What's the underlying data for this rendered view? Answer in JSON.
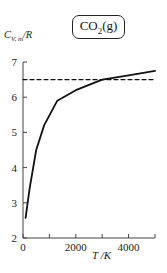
{
  "chart_data": {
    "type": "line",
    "title": "CO2(g)",
    "xlabel": "T /K",
    "ylabel": "C_V,m/R",
    "xlim": [
      0,
      5000
    ],
    "ylim": [
      2,
      7
    ],
    "xticks": [
      0,
      1000,
      2000,
      3000,
      4000,
      5000
    ],
    "xtick_labels": [
      "0",
      "",
      "2000",
      "",
      "4000",
      ""
    ],
    "yticks": [
      2,
      3,
      4,
      5,
      6,
      7
    ],
    "ytick_labels": [
      "2",
      "3",
      "4",
      "5",
      "6",
      "7"
    ],
    "grid": false,
    "legend": "none",
    "series": [
      {
        "name": "C_V,m/R (CO2)",
        "style": "solid",
        "x": [
          100,
          250,
          500,
          800,
          1300,
          2000,
          3000,
          4000,
          5000
        ],
        "values": [
          2.57,
          3.4,
          4.5,
          5.2,
          5.9,
          6.2,
          6.5,
          6.62,
          6.75
        ]
      },
      {
        "name": "classical limit",
        "style": "dashed",
        "x": [
          0,
          5000
        ],
        "values": [
          6.5,
          6.5
        ]
      }
    ]
  },
  "labels": {
    "species_main": "CO",
    "species_sub": "2",
    "species_phase": "(g)",
    "ylabel_C": "C",
    "ylabel_sub": "V, m",
    "ylabel_rest": "/R",
    "xlabel": "T /K"
  }
}
